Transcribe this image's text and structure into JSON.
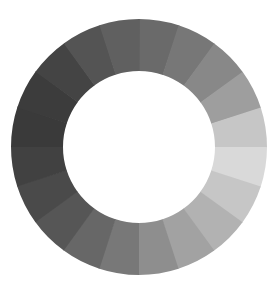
{
  "graphic": {
    "type": "segmented-grayscale-ring",
    "center": [
      139,
      147
    ],
    "outer_radius": 128,
    "inner_radius": 76,
    "start_angle_deg": 0,
    "segment_count": 20,
    "segments": [
      "#6a6a6a",
      "#777777",
      "#888888",
      "#9e9e9e",
      "#c6c6c6",
      "#d9d9d9",
      "#c6c6c6",
      "#b2b2b2",
      "#a2a2a2",
      "#8e8e8e",
      "#787878",
      "#676767",
      "#565656",
      "#4a4a4a",
      "#414141",
      "#3a3a3a",
      "#3c3c3c",
      "#444444",
      "#545454",
      "#606060"
    ],
    "background": "#ffffff"
  }
}
